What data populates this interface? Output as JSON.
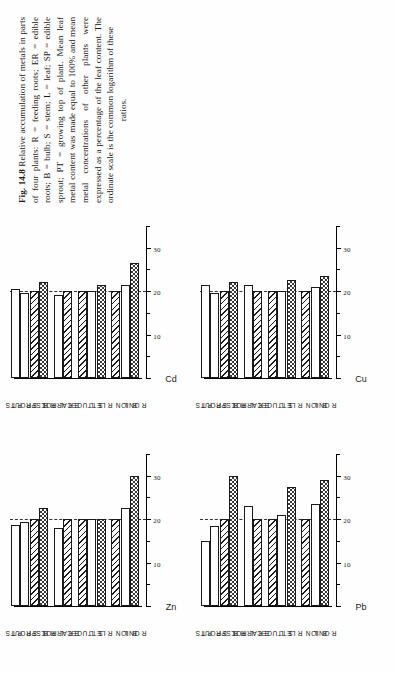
{
  "figure": {
    "number": "Fig. 14.8",
    "caption_body": "Relative accumulation of metals in parts of four plants: R = feeding roots; ER = edible roots; B = bulb; S = stem; L = leaf; SP = edible sprout; PT = growing top of plant. Mean leaf metal content was made equal to 100% and mean metal concentrations of other plants were expressed as a percentage of the leaf content. The ordinate scale is the common logarithm of these",
    "caption_tail": "ratios."
  },
  "axis": {
    "tick_labels": [
      "30",
      "20",
      "10"
    ],
    "tick_values": [
      30,
      20,
      10
    ],
    "reference_value": 20,
    "range": [
      0,
      35
    ]
  },
  "legend_keys": {
    "solid": "feeding-roots-or-edible-roots",
    "hatch": "leaf",
    "open": "other-part"
  },
  "groups": [
    {
      "name": "ONION",
      "parts": [
        "R",
        "B",
        "L"
      ]
    },
    {
      "name": "LETTUCE",
      "parts": [
        "R",
        "S",
        "L"
      ]
    },
    {
      "name": "CARROT",
      "parts": [
        "ER",
        "L"
      ]
    },
    {
      "name": "B.SPROUTS",
      "parts": [
        "R",
        "L",
        "SP",
        "PT"
      ]
    }
  ],
  "chart_data": [
    {
      "type": "bar",
      "title": "Zn",
      "xlabel": "",
      "ylabel": "Zn",
      "ylim": [
        0,
        35
      ],
      "grid": false,
      "legend": "none",
      "reference_line": 20,
      "categories": [
        "ONION R",
        "ONION B",
        "ONION L",
        "LETTUCE R",
        "LETTUCE S",
        "LETTUCE L",
        "CARROT ER",
        "CARROT L",
        "B.SPROUTS R",
        "B.SPROUTS L",
        "B.SPROUTS SP",
        "B.SPROUTS PT"
      ],
      "values": [
        30.0,
        22.5,
        20.0,
        20.0,
        20.0,
        20.0,
        20.0,
        18.0,
        22.5,
        20.0,
        19.3,
        18.6
      ],
      "patterns": [
        "solid",
        "open",
        "hatch",
        "solid",
        "open",
        "hatch",
        "hatch",
        "open",
        "solid",
        "hatch",
        "open",
        "open"
      ]
    },
    {
      "type": "bar",
      "title": "Pb",
      "xlabel": "",
      "ylabel": "Pb",
      "ylim": [
        0,
        35
      ],
      "grid": false,
      "legend": "none",
      "reference_line": 20,
      "categories": [
        "ONION R",
        "ONION B",
        "ONION L",
        "LETTUCE R",
        "LETTUCE S",
        "LETTUCE L",
        "CARROT ER",
        "CARROT L",
        "B.SPROUTS R",
        "B.SPROUTS L",
        "B.SPROUTS SP",
        "B.SPROUTS PT"
      ],
      "values": [
        29.0,
        23.5,
        20.0,
        27.5,
        21.0,
        20.0,
        20.0,
        23.0,
        30.0,
        20.0,
        18.5,
        15.0
      ],
      "patterns": [
        "solid",
        "open",
        "hatch",
        "solid",
        "open",
        "hatch",
        "hatch",
        "open",
        "solid",
        "hatch",
        "open",
        "open"
      ]
    },
    {
      "type": "bar",
      "title": "Cd",
      "xlabel": "",
      "ylabel": "Cd",
      "ylim": [
        0,
        35
      ],
      "grid": false,
      "legend": "none",
      "reference_line": 20,
      "categories": [
        "ONION R",
        "ONION B",
        "ONION L",
        "LETTUCE R",
        "LETTUCE S",
        "LETTUCE L",
        "CARROT ER",
        "CARROT L",
        "B.SPROUTS R",
        "B.SPROUTS L",
        "B.SPROUTS SP",
        "B.SPROUTS PT"
      ],
      "values": [
        26.5,
        21.5,
        20.0,
        21.5,
        20.0,
        20.0,
        20.0,
        19.0,
        22.0,
        20.0,
        19.5,
        20.5
      ],
      "patterns": [
        "solid",
        "open",
        "hatch",
        "solid",
        "open",
        "hatch",
        "hatch",
        "open",
        "solid",
        "hatch",
        "open",
        "open"
      ]
    },
    {
      "type": "bar",
      "title": "Cu",
      "xlabel": "",
      "ylabel": "Cu",
      "ylim": [
        0,
        35
      ],
      "grid": false,
      "legend": "none",
      "reference_line": 20,
      "categories": [
        "ONION R",
        "ONION B",
        "ONION L",
        "LETTUCE R",
        "LETTUCE S",
        "LETTUCE L",
        "CARROT ER",
        "CARROT L",
        "B.SPROUTS R",
        "B.SPROUTS L",
        "B.SPROUTS SP",
        "B.SPROUTS PT"
      ],
      "values": [
        23.5,
        21.0,
        20.0,
        22.5,
        20.0,
        20.0,
        20.0,
        21.5,
        22.0,
        20.0,
        19.5,
        21.5
      ],
      "patterns": [
        "solid",
        "open",
        "hatch",
        "solid",
        "open",
        "hatch",
        "hatch",
        "open",
        "solid",
        "hatch",
        "open",
        "open"
      ]
    }
  ]
}
